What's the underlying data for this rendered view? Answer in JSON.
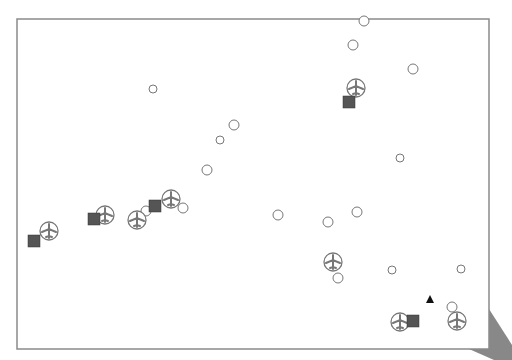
{
  "map": {
    "frame": {
      "x": 17,
      "y": 19,
      "width": 472,
      "height": 330,
      "stroke": "#8a8a8a"
    },
    "colors": {
      "circle_stroke": "#777777",
      "square_fill": "#555555",
      "airport": "#777777",
      "triangle": "#111111",
      "shadow": "#888888"
    },
    "circles": [
      {
        "cx": 364,
        "cy": 21,
        "r": 5
      },
      {
        "cx": 353,
        "cy": 45,
        "r": 5
      },
      {
        "cx": 413,
        "cy": 69,
        "r": 5
      },
      {
        "cx": 153,
        "cy": 89,
        "r": 4
      },
      {
        "cx": 234,
        "cy": 125,
        "r": 5
      },
      {
        "cx": 220,
        "cy": 140,
        "r": 4
      },
      {
        "cx": 400,
        "cy": 158,
        "r": 4
      },
      {
        "cx": 207,
        "cy": 170,
        "r": 5
      },
      {
        "cx": 146,
        "cy": 211,
        "r": 5
      },
      {
        "cx": 183,
        "cy": 208,
        "r": 5
      },
      {
        "cx": 278,
        "cy": 215,
        "r": 5
      },
      {
        "cx": 357,
        "cy": 212,
        "r": 5
      },
      {
        "cx": 328,
        "cy": 222,
        "r": 5
      },
      {
        "cx": 338,
        "cy": 278,
        "r": 5
      },
      {
        "cx": 392,
        "cy": 270,
        "r": 4
      },
      {
        "cx": 461,
        "cy": 269,
        "r": 4
      },
      {
        "cx": 452,
        "cy": 307,
        "r": 5
      }
    ],
    "airports": [
      {
        "cx": 356,
        "cy": 88
      },
      {
        "cx": 49,
        "cy": 231
      },
      {
        "cx": 105,
        "cy": 215
      },
      {
        "cx": 137,
        "cy": 220
      },
      {
        "cx": 171,
        "cy": 199
      },
      {
        "cx": 333,
        "cy": 262
      },
      {
        "cx": 400,
        "cy": 322
      },
      {
        "cx": 457,
        "cy": 321
      }
    ],
    "squares": [
      {
        "x": 343,
        "y": 96
      },
      {
        "x": 28,
        "y": 235
      },
      {
        "x": 88,
        "y": 213
      },
      {
        "x": 149,
        "y": 200
      },
      {
        "x": 407,
        "y": 315
      }
    ],
    "triangles": [
      {
        "x": 430,
        "y": 300
      }
    ]
  }
}
